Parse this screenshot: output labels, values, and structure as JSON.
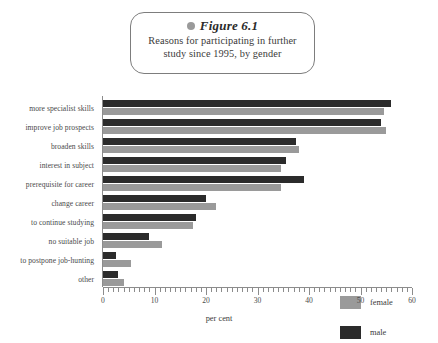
{
  "figure": {
    "marker_icon": "bullet-dot-icon",
    "label": "Figure 6.1",
    "subtitle_line1": "Reasons for participating in further",
    "subtitle_line2": "study since 1995, by gender"
  },
  "legend": {
    "position": "right-middle",
    "entries": [
      {
        "label": "female",
        "color": "#9a9a9a"
      },
      {
        "label": "male",
        "color": "#2b2b2b"
      }
    ]
  },
  "chart_data": {
    "type": "bar",
    "orientation": "horizontal",
    "title": "Figure 6.1 Reasons for participating in further study since 1995, by gender",
    "xlabel": "per cent",
    "ylabel": "",
    "xlim": [
      0,
      60
    ],
    "xticks": [
      0,
      10,
      20,
      30,
      40,
      50,
      60
    ],
    "xtick_labels": [
      "0",
      "10",
      "20",
      "30",
      "40",
      "50",
      "60"
    ],
    "minor_tick_step": 1,
    "grid": false,
    "categories": [
      "more specialist skills",
      "improve job prospects",
      "broaden skills",
      "interest in subject",
      "prerequisite for career",
      "change career",
      "to continue studying",
      "no suitable job",
      "to postpone job-hunting",
      "other"
    ],
    "series": [
      {
        "name": "male",
        "color": "#2b2b2b",
        "values": [
          56,
          54,
          37.5,
          35.5,
          39,
          20,
          18,
          9,
          2.5,
          3
        ]
      },
      {
        "name": "female",
        "color": "#9a9a9a",
        "values": [
          54.5,
          55,
          38,
          34.5,
          34.5,
          22,
          17.5,
          11.5,
          5.5,
          4
        ]
      }
    ]
  }
}
